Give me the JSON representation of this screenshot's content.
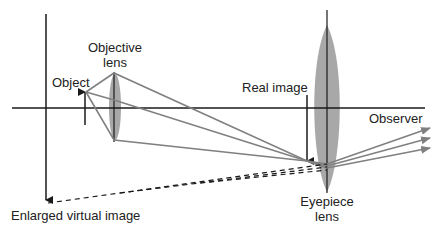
{
  "diagram": {
    "labels": {
      "objective_lens": [
        "Objective",
        "lens"
      ],
      "object": "Object",
      "real_image": "Real image",
      "observer": "Observer",
      "eyepiece_lens": [
        "Eyepiece",
        "lens"
      ],
      "enlarged_virtual_image": "Enlarged virtual image"
    },
    "colors": {
      "axis": "#1a1a1a",
      "rays": "#808080",
      "lens_fill": "#a8a8a8",
      "text": "#222222"
    }
  }
}
